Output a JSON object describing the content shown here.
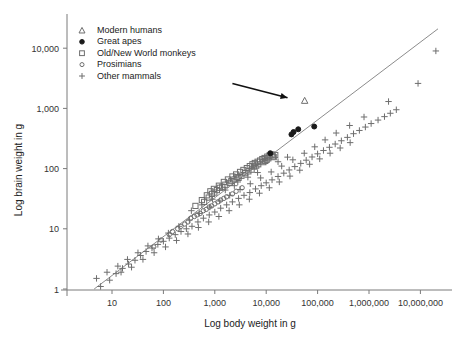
{
  "chart_data": {
    "type": "scatter",
    "title": "",
    "xlabel": "Log body weight in g",
    "ylabel": "Log brain weight in g",
    "xscale": "log",
    "yscale": "log",
    "xlim": [
      3,
      30000000
    ],
    "ylim": [
      0.8,
      30000
    ],
    "xticks": [
      10,
      100,
      1000,
      10000,
      100000,
      1000000,
      10000000
    ],
    "xtick_labels": [
      "10",
      "100",
      "1,000",
      "10,000",
      "100,000",
      "1,000,000",
      "10,000,000"
    ],
    "yticks": [
      1,
      10,
      100,
      1000,
      10000
    ],
    "ytick_labels": [
      "1",
      "10",
      "100",
      "1,000",
      "10,000"
    ],
    "grid": false,
    "legend_position": "top-left",
    "legend": [
      {
        "label": "Modern humans",
        "marker": "triangle-open"
      },
      {
        "label": "Great apes",
        "marker": "circle-filled"
      },
      {
        "label": "Old/New World monkeys",
        "marker": "square-open"
      },
      {
        "label": "Prosimians",
        "marker": "circle-open"
      },
      {
        "label": "Other mammals",
        "marker": "plus"
      }
    ],
    "annotations": [
      {
        "name": "arrow-to-modern-human",
        "type": "arrow",
        "points_to_series": "Modern humans",
        "x_start": 2200,
        "y_start": 2600,
        "x_end": 26000,
        "y_end": 1500
      }
    ],
    "fit_line": {
      "name": "allometric-regression",
      "x1": 4.5,
      "y1": 1.0,
      "x2": 22000000,
      "y2": 21000
    },
    "series": [
      {
        "name": "Modern humans",
        "marker": "triangle-open",
        "points": [
          [
            56000,
            1350
          ]
        ]
      },
      {
        "name": "Great apes",
        "marker": "circle-filled",
        "points": [
          [
            34000,
            405
          ],
          [
            42000,
            450
          ],
          [
            86000,
            500
          ],
          [
            31000,
            370
          ],
          [
            12000,
            180
          ]
        ]
      },
      {
        "name": "Old/New World monkeys",
        "marker": "square-open",
        "points": [
          [
            420,
            24
          ],
          [
            560,
            30
          ],
          [
            700,
            36
          ],
          [
            820,
            42
          ],
          [
            960,
            46
          ],
          [
            1200,
            52
          ],
          [
            1500,
            60
          ],
          [
            1800,
            66
          ],
          [
            2200,
            74
          ],
          [
            2600,
            80
          ],
          [
            3100,
            88
          ],
          [
            3600,
            95
          ],
          [
            4200,
            102
          ],
          [
            4800,
            110
          ],
          [
            5400,
            118
          ],
          [
            6000,
            124
          ],
          [
            6800,
            130
          ],
          [
            7600,
            136
          ],
          [
            8400,
            144
          ],
          [
            9300,
            150
          ],
          [
            10500,
            158
          ],
          [
            11600,
            165
          ],
          [
            12800,
            172
          ],
          [
            5200,
            96
          ],
          [
            3900,
            84
          ],
          [
            2900,
            70
          ],
          [
            2100,
            62
          ],
          [
            1600,
            54
          ],
          [
            1250,
            48
          ],
          [
            980,
            40
          ],
          [
            760,
            33
          ],
          [
            620,
            28
          ],
          [
            7000,
            118
          ],
          [
            8800,
            128
          ],
          [
            10200,
            140
          ],
          [
            13500,
            160
          ],
          [
            15000,
            168
          ],
          [
            4500,
            90
          ],
          [
            3300,
            76
          ],
          [
            2400,
            66
          ],
          [
            1400,
            50
          ],
          [
            1100,
            44
          ],
          [
            880,
            38
          ],
          [
            5800,
            108
          ],
          [
            6400,
            112
          ],
          [
            9600,
            134
          ],
          [
            11000,
            148
          ],
          [
            14000,
            155
          ],
          [
            2750,
            72
          ],
          [
            1950,
            58
          ]
        ]
      },
      {
        "name": "Prosimians",
        "marker": "circle-open",
        "points": [
          [
            65,
            5
          ],
          [
            90,
            6.5
          ],
          [
            130,
            8
          ],
          [
            190,
            10
          ],
          [
            260,
            12
          ],
          [
            340,
            15
          ],
          [
            450,
            17
          ],
          [
            600,
            20
          ],
          [
            780,
            23
          ],
          [
            1000,
            26
          ],
          [
            1300,
            30
          ],
          [
            1700,
            34
          ],
          [
            2200,
            38
          ],
          [
            150,
            9
          ],
          [
            220,
            11
          ],
          [
            300,
            13
          ],
          [
            400,
            16
          ],
          [
            520,
            18
          ],
          [
            680,
            21
          ],
          [
            870,
            24
          ],
          [
            1150,
            28
          ],
          [
            1500,
            32
          ],
          [
            2600,
            42
          ],
          [
            3400,
            48
          ]
        ]
      },
      {
        "name": "Other mammals",
        "marker": "plus",
        "points": [
          [
            6,
            1.1
          ],
          [
            9,
            1.4
          ],
          [
            12,
            1.8
          ],
          [
            16,
            2.2
          ],
          [
            21,
            2.6
          ],
          [
            28,
            3.0
          ],
          [
            36,
            3.6
          ],
          [
            46,
            4.2
          ],
          [
            60,
            4.8
          ],
          [
            78,
            5.5
          ],
          [
            100,
            6.2
          ],
          [
            130,
            7.0
          ],
          [
            170,
            8.0
          ],
          [
            220,
            9.0
          ],
          [
            280,
            10
          ],
          [
            360,
            11
          ],
          [
            470,
            13
          ],
          [
            600,
            15
          ],
          [
            780,
            17
          ],
          [
            1000,
            19
          ],
          [
            1300,
            22
          ],
          [
            1700,
            25
          ],
          [
            2200,
            28
          ],
          [
            2900,
            32
          ],
          [
            3700,
            36
          ],
          [
            4800,
            40
          ],
          [
            6200,
            46
          ],
          [
            8000,
            52
          ],
          [
            10000,
            58
          ],
          [
            13000,
            65
          ],
          [
            17000,
            74
          ],
          [
            22000,
            84
          ],
          [
            28000,
            95
          ],
          [
            36000,
            108
          ],
          [
            47000,
            122
          ],
          [
            60000,
            138
          ],
          [
            78000,
            156
          ],
          [
            100000,
            176
          ],
          [
            130000,
            200
          ],
          [
            170000,
            226
          ],
          [
            220000,
            256
          ],
          [
            290000,
            290
          ],
          [
            380000,
            330
          ],
          [
            500000,
            380
          ],
          [
            650000,
            430
          ],
          [
            850000,
            490
          ],
          [
            1100000,
            560
          ],
          [
            1500000,
            640
          ],
          [
            2000000,
            730
          ],
          [
            2600000,
            830
          ],
          [
            3400000,
            950
          ],
          [
            20000000,
            9000
          ],
          [
            9000000,
            2600
          ],
          [
            2400000,
            1300
          ],
          [
            800000,
            720
          ],
          [
            420000,
            520
          ],
          [
            230000,
            390
          ],
          [
            140000,
            300
          ],
          [
            88000,
            230
          ],
          [
            55000,
            180
          ],
          [
            33000,
            140
          ],
          [
            20000,
            110
          ],
          [
            12500,
            88
          ],
          [
            7800,
            70
          ],
          [
            4900,
            56
          ],
          [
            3100,
            45
          ],
          [
            1950,
            36
          ],
          [
            1250,
            29
          ],
          [
            800,
            23
          ],
          [
            500,
            18
          ],
          [
            320,
            14
          ],
          [
            200,
            11
          ],
          [
            125,
            8.5
          ],
          [
            80,
            6.8
          ],
          [
            50,
            5.2
          ],
          [
            32,
            4.0
          ],
          [
            20,
            3.1
          ],
          [
            13,
            2.4
          ],
          [
            8,
            1.9
          ],
          [
            5,
            1.5
          ],
          [
            15,
            1.9
          ],
          [
            24,
            2.3
          ],
          [
            40,
            3.1
          ],
          [
            66,
            4.0
          ],
          [
            110,
            5.0
          ],
          [
            180,
            6.4
          ],
          [
            300,
            8.2
          ],
          [
            480,
            10.5
          ],
          [
            760,
            13
          ],
          [
            1200,
            16
          ],
          [
            1900,
            20
          ],
          [
            3000,
            25
          ],
          [
            4700,
            31
          ],
          [
            7400,
            39
          ],
          [
            11500,
            48
          ],
          [
            18000,
            60
          ],
          [
            29000,
            75
          ],
          [
            45000,
            94
          ],
          [
            70000,
            118
          ],
          [
            110000,
            145
          ],
          [
            175000,
            180
          ],
          [
            275000,
            220
          ],
          [
            430000,
            270
          ],
          [
            2800,
            60
          ],
          [
            4400,
            72
          ],
          [
            6800,
            86
          ],
          [
            17000,
            130
          ],
          [
            26000,
            155
          ],
          [
            1600,
            44
          ],
          [
            2400,
            52
          ],
          [
            900,
            31
          ],
          [
            560,
            25
          ],
          [
            350,
            20
          ]
        ]
      }
    ]
  }
}
